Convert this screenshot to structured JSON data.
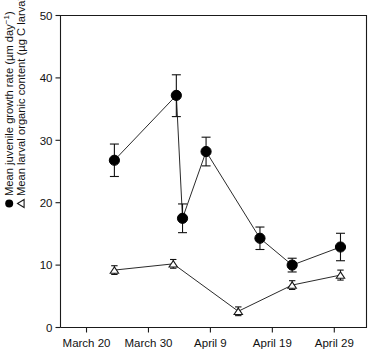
{
  "chart_data": {
    "type": "line",
    "title": "",
    "xlabel": "",
    "ylabel": "Mean juvenile growth rate (µm day⁻¹) / Mean larval organic content (µg C larva⁻¹)",
    "ylim": [
      0,
      50
    ],
    "yticks": [
      0,
      10,
      20,
      30,
      40,
      50
    ],
    "ytick_labels": [
      "0",
      "10",
      "20",
      "30",
      "40",
      "50"
    ],
    "xtick_labels": [
      "March 20",
      "March 30",
      "April 9",
      "April 19",
      "April 29"
    ],
    "xtick_days": [
      20,
      30,
      40,
      50,
      60
    ],
    "xlim_days": [
      15.8,
      65.2
    ],
    "grid": false,
    "legend_position": "y-axis-label",
    "series": [
      {
        "name": "Mean juvenile growth rate",
        "marker": "filled-circle",
        "units": "µm day⁻¹",
        "x_days": [
          24.5,
          34.5,
          35.5,
          39.3,
          44.0,
          48.8,
          53.5,
          58.5,
          66.5
        ],
        "x_labels": [
          "March 24",
          "April 3",
          "April 4",
          "April 8",
          "April 12",
          "April 17",
          "April 22",
          "April 27",
          "May 5"
        ],
        "values": [
          26.8,
          37.2,
          17.5,
          28.2,
          14.3,
          10.0,
          12.9
        ],
        "points": [
          {
            "x_day": 24.5,
            "y": 26.8,
            "err_low": 2.6,
            "err_high": 2.6
          },
          {
            "x_day": 34.5,
            "y": 37.2,
            "err_low": 3.4,
            "err_high": 3.3
          },
          {
            "x_day": 35.5,
            "y": 17.5,
            "err_low": 2.3,
            "err_high": 2.3
          },
          {
            "x_day": 39.3,
            "y": 28.2,
            "err_low": 2.3,
            "err_high": 2.3
          },
          {
            "x_day": 48.0,
            "y": 14.3,
            "err_low": 1.8,
            "err_high": 1.8
          },
          {
            "x_day": 53.2,
            "y": 10.0,
            "err_low": 1.1,
            "err_high": 1.1
          },
          {
            "x_day": 61.0,
            "y": 12.9,
            "err_low": 2.2,
            "err_high": 2.2
          }
        ]
      },
      {
        "name": "Mean larval organic content",
        "marker": "open-triangle",
        "units": "µg C larva⁻¹",
        "x_days": [
          24.5,
          34.0,
          44.5,
          53.2,
          61.0
        ],
        "values": [
          9.2,
          10.2,
          2.6,
          6.8,
          8.4
        ],
        "points": [
          {
            "x_day": 24.5,
            "y": 9.2,
            "err_low": 0.7,
            "err_high": 0.7
          },
          {
            "x_day": 34.0,
            "y": 10.2,
            "err_low": 0.7,
            "err_high": 0.7
          },
          {
            "x_day": 44.5,
            "y": 2.6,
            "err_low": 0.7,
            "err_high": 0.7
          },
          {
            "x_day": 53.2,
            "y": 6.8,
            "err_low": 0.7,
            "err_high": 0.7
          },
          {
            "x_day": 61.0,
            "y": 8.4,
            "err_low": 0.8,
            "err_high": 0.8
          }
        ]
      }
    ]
  },
  "axis_title": {
    "line1_prefix": "Mean juvenile growth rate (µm day",
    "line1_sup": "−1",
    "line1_suffix": ")",
    "line2_prefix": "Mean larval organic content (µg C larva",
    "line2_sup": "−1",
    "line2_suffix": ")"
  },
  "colors": {
    "axis": "#1a1a1a",
    "series_circle": "#000000",
    "series_triangle_fill": "#ffffff",
    "series_triangle_stroke": "#1a1a1a",
    "background": "#ffffff"
  }
}
